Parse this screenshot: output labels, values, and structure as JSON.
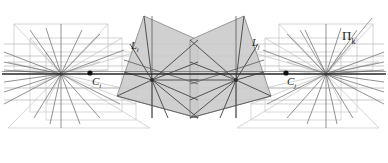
{
  "figure": {
    "name": "two-view-epipolar-geometry-diagram",
    "width": 388,
    "height": 163,
    "background": "#ffffff"
  },
  "labels": {
    "plane_left": {
      "base": "L",
      "sub": "i",
      "x": 131,
      "y": 41
    },
    "plane_right": {
      "base": "L",
      "sub": "j",
      "x": 252,
      "y": 38
    },
    "pi_plane": {
      "base": "Π",
      "sub": "k",
      "x": 342,
      "y": 29
    },
    "camera_left": {
      "base": "C",
      "sub": "i",
      "x": 92,
      "y": 82
    },
    "camera_right": {
      "base": "C",
      "sub": "j",
      "x": 287,
      "y": 82
    }
  },
  "colors": {
    "shade_fill": "#c8c8c8",
    "shade_stroke": "#8c8c8c",
    "line_dark": "#3a3a3a",
    "line_mid": "#7a7a7a",
    "line_light": "#b0b0b0",
    "line_faint": "#c9c9c9",
    "baseline": "#2b2b2b",
    "point": "#111111"
  },
  "geometry": {
    "camera_center_left": {
      "x": 61,
      "y": 74
    },
    "camera_center_right": {
      "x": 326,
      "y": 74
    },
    "pencil_node_left": {
      "x": 152,
      "y": 80
    },
    "pencil_node_right": {
      "x": 236,
      "y": 80
    },
    "baseline_y": 74,
    "shaded_quad_left": [
      [
        144,
        18
      ],
      [
        196,
        40
      ],
      [
        196,
        118
      ],
      [
        118,
        96
      ]
    ],
    "shaded_quad_right": [
      [
        244,
        18
      ],
      [
        192,
        40
      ],
      [
        192,
        118
      ],
      [
        270,
        96
      ]
    ],
    "pi_plane_apex": {
      "x": 326,
      "y": 74
    }
  },
  "elements": {
    "shade_left_name": "image-plane-left",
    "shade_right_name": "image-plane-right",
    "pencil_left_name": "line-pencil-left",
    "pencil_right_name": "line-pencil-right",
    "baseline_name": "baseline",
    "frame_left_name": "wireframe-left",
    "frame_right_name": "wireframe-right"
  }
}
